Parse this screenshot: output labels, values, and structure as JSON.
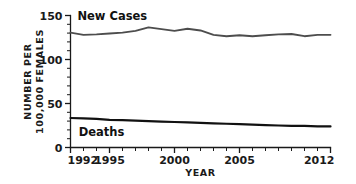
{
  "chart_data": {
    "type": "line",
    "title": "",
    "xlabel": "YEAR",
    "ylabel": "NUMBER PER 100,000 FEMALES",
    "ylabel_line1": "NUMBER PER",
    "ylabel_line2": "100,000 FEMALES",
    "xlim": [
      1992,
      2012
    ],
    "ylim": [
      0,
      150
    ],
    "grid": false,
    "legend_position": "inline-annotations",
    "y_ticks_major": [
      0,
      50,
      100,
      150
    ],
    "y_tick_labels": [
      "0",
      "50",
      "100",
      "150"
    ],
    "y_tick_minor_step": 10,
    "x_ticks_major": [
      1992,
      1995,
      2000,
      2005,
      2012
    ],
    "x_tick_labels": [
      "1992",
      "1995",
      "2000",
      "2005",
      "2012"
    ],
    "x_tick_minor_step": 1,
    "x": [
      1992,
      1993,
      1994,
      1995,
      1996,
      1997,
      1998,
      1999,
      2000,
      2001,
      2002,
      2003,
      2004,
      2005,
      2006,
      2007,
      2008,
      2009,
      2010,
      2011,
      2012
    ],
    "series": [
      {
        "name": "New Cases",
        "color": "#4d4d4d",
        "label_x": 1992.3,
        "label_y": 150,
        "values": [
          130.5,
          128.0,
          128.5,
          129.5,
          130.5,
          132.5,
          136.5,
          134.5,
          132.5,
          135.0,
          133.0,
          128.0,
          126.5,
          127.5,
          126.5,
          127.5,
          128.5,
          129.0,
          126.5,
          128.0,
          128.0
        ]
      },
      {
        "name": "Deaths",
        "color": "#111111",
        "label_x": 1992.4,
        "label_y": 18,
        "values": [
          33.5,
          33.0,
          32.5,
          31.5,
          31.0,
          30.5,
          30.0,
          29.5,
          29.0,
          28.5,
          28.0,
          27.5,
          27.0,
          26.5,
          26.0,
          25.5,
          25.0,
          24.5,
          24.5,
          24.0,
          24.0
        ]
      }
    ]
  },
  "colors": {
    "background": "#ffffff",
    "axis": "#1a1a1a",
    "new_cases": "#4d4d4d",
    "deaths": "#111111"
  }
}
